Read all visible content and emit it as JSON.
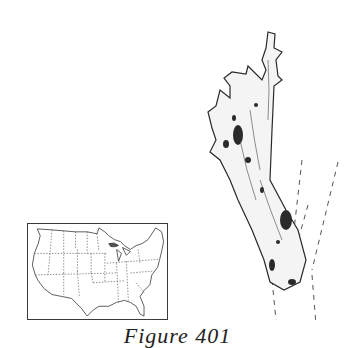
{
  "figure": {
    "caption": "Figure 401",
    "map": {
      "subject": "us-range-map",
      "region": "Contiguous United States with state boundaries"
    },
    "illustration": {
      "subject": "lichen-specimen-drawing",
      "description": "Ink drawing of a branching lichen thallus on a twig, twig outline shown with dashed lines"
    }
  },
  "colors": {
    "ink": "#2a2a2a",
    "background": "#ffffff"
  }
}
